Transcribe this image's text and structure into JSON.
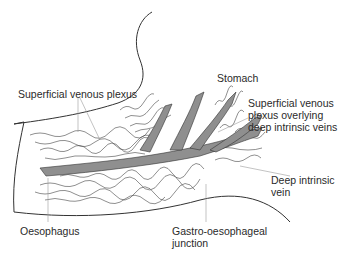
{
  "diagram": {
    "colors": {
      "background": "#ffffff",
      "outline": "#333333",
      "vein_fill": "#8f8f8f",
      "leader_line": "#9a9a9a",
      "text": "#2a2a2a"
    },
    "labels": {
      "stomach": "Stomach",
      "superficial_plexus": "Superficial venous plexus",
      "overlying_line1": "Superficial venous",
      "overlying_line2": "plexus overlying",
      "overlying_line3": "deep intrinsic veins",
      "deep_vein_line1": "Deep intrinsic",
      "deep_vein_line2": "vein",
      "oesophagus": "Oesophagus",
      "gej_line1": "Gastro-oesophageal",
      "gej_line2": "junction"
    }
  }
}
